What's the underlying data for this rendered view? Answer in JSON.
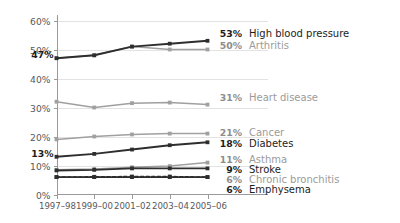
{
  "chart_data": {
    "type": "line",
    "title": "",
    "subtitle": "",
    "xlabel": "",
    "ylabel": "",
    "ylim": [
      0,
      60
    ],
    "ytick_labels": [
      "0%",
      "10%",
      "20%",
      "30%",
      "40%",
      "50%",
      "60%"
    ],
    "ytick_values": [
      0,
      10,
      20,
      30,
      40,
      50,
      60
    ],
    "grid": true,
    "legend_position": "right-inline-end-labels",
    "categories": [
      "1997–98",
      "1999–00",
      "2001–02",
      "2003–04",
      "2005–06"
    ],
    "series": [
      {
        "name": "High blood pressure",
        "values": [
          47,
          48,
          51,
          52,
          53
        ],
        "end_value_label": "53%",
        "start_value_label": "47%",
        "style": "solid",
        "color": "#2e2e2e",
        "tone": "dark"
      },
      {
        "name": "Arthritis",
        "values": [
          47,
          48,
          51,
          50,
          50
        ],
        "end_value_label": "50%",
        "start_value_label": "",
        "style": "solid",
        "color": "#a0a0a0",
        "tone": "gray"
      },
      {
        "name": "Heart disease",
        "values": [
          32,
          30,
          31.5,
          31.7,
          31
        ],
        "end_value_label": "31%",
        "start_value_label": "",
        "style": "solid",
        "color": "#a0a0a0",
        "tone": "gray"
      },
      {
        "name": "Cancer",
        "values": [
          19,
          20,
          20.7,
          21,
          21
        ],
        "end_value_label": "21%",
        "start_value_label": "",
        "style": "solid",
        "color": "#a0a0a0",
        "tone": "gray"
      },
      {
        "name": "Diabetes",
        "values": [
          13,
          14,
          15.5,
          17,
          18
        ],
        "end_value_label": "18%",
        "start_value_label": "13%",
        "style": "solid",
        "color": "#2e2e2e",
        "tone": "dark"
      },
      {
        "name": "Asthma",
        "values": [
          8.5,
          8.8,
          9.4,
          9.8,
          11
        ],
        "end_value_label": "11%",
        "start_value_label": "",
        "style": "solid",
        "color": "#a0a0a0",
        "tone": "gray"
      },
      {
        "name": "Stroke",
        "values": [
          8.3,
          8.5,
          9,
          9,
          9
        ],
        "end_value_label": "9%",
        "start_value_label": "",
        "style": "solid",
        "color": "#2e2e2e",
        "tone": "dark"
      },
      {
        "name": "Chronic bronchitis",
        "values": [
          6,
          6.1,
          6.2,
          6.2,
          6
        ],
        "end_value_label": "6%",
        "start_value_label": "",
        "style": "dashed",
        "color": "#2e2e2e",
        "tone": "dark"
      },
      {
        "name": "Emphysema",
        "values": [
          6,
          6,
          6,
          6,
          6
        ],
        "end_value_label": "6%",
        "start_value_label": "",
        "style": "solid",
        "color": "#2e2e2e",
        "tone": "dark"
      }
    ],
    "end_labels": [
      {
        "value": "53%",
        "name": "High blood pressure",
        "tone": "dark",
        "y": 37
      },
      {
        "value": "50%",
        "name": "Arthritis",
        "tone": "gray",
        "y": 49
      },
      {
        "value": "31%",
        "name": "Heart disease",
        "tone": "gray",
        "y": 101
      },
      {
        "value": "21%",
        "name": "Cancer",
        "tone": "gray",
        "y": 136
      },
      {
        "value": "18%",
        "name": "Diabetes",
        "tone": "dark",
        "y": 147
      },
      {
        "value": "11%",
        "name": "Asthma",
        "tone": "gray",
        "y": 163
      },
      {
        "value": "9%",
        "name": "Stroke",
        "tone": "dark",
        "y": 173
      },
      {
        "value": "6%",
        "name": "Chronic bronchitis",
        "tone": "gray",
        "y": 183
      },
      {
        "value": "6%",
        "name": "Emphysema",
        "tone": "dark",
        "y": 193
      }
    ],
    "start_labels": [
      {
        "value": "47%",
        "y": 58
      },
      {
        "value": "13%",
        "y": 157
      }
    ]
  }
}
